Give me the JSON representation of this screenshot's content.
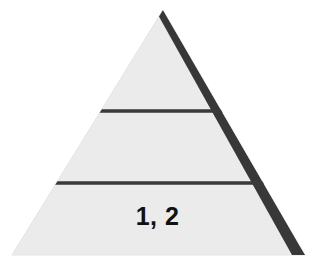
{
  "figure": {
    "type": "pyramid-diagram",
    "background_color": "#ffffff",
    "shape_name": "three-tier-pyramid",
    "fill_color": "#efefef",
    "edge_shadow_color": "#383838",
    "divider_color": "#3a3a3a",
    "label_color": "#111111",
    "apex": {
      "x": 163,
      "y": 10
    },
    "base_left": {
      "x": 12,
      "y": 255
    },
    "base_right": {
      "x": 305,
      "y": 255
    }
  },
  "tiers": [
    {
      "name": "top-tier",
      "label": "",
      "divider_below_y": 111
    },
    {
      "name": "middle-tier",
      "label": "",
      "divider_below_y": 183
    },
    {
      "name": "bottom-tier",
      "label": "1, 2",
      "divider_below_y": 255
    }
  ],
  "dividers": [
    {
      "name": "upper-divider",
      "y": 111,
      "x_start": 95,
      "x_end": 222,
      "thickness": 3
    },
    {
      "name": "lower-divider",
      "y": 183,
      "x_start": 55,
      "x_end": 262,
      "thickness": 3
    }
  ],
  "labels": {
    "bottom_tier_text": "1, 2"
  }
}
